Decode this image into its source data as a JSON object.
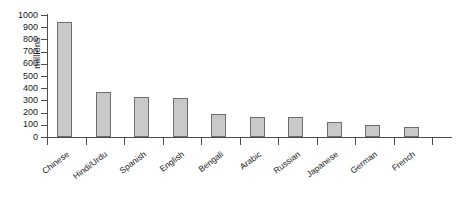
{
  "chart_data": {
    "type": "bar",
    "title": "",
    "xlabel": "",
    "ylabel": "millions",
    "ylim": [
      0,
      1000
    ],
    "ytick_step": 100,
    "grid": false,
    "legend": "none",
    "categories": [
      "Chinese",
      "Hindi/Urdu",
      "Spanish",
      "English",
      "Bengali",
      "Arabic",
      "Russian",
      "Japanese",
      "German",
      "French"
    ],
    "values": [
      940,
      370,
      330,
      320,
      185,
      160,
      160,
      120,
      95,
      78
    ],
    "ytick_labels": [
      "1000",
      "900",
      "800",
      "700",
      "600",
      "500",
      "400",
      "300",
      "200",
      "100",
      "0"
    ],
    "ytick_values": [
      1000,
      900,
      800,
      700,
      600,
      500,
      400,
      300,
      200,
      100,
      0
    ],
    "bar_fill": "#c9c9c9",
    "bar_border": "#6e6e6e",
    "axis_color": "#4c4c4c",
    "background": "#ffffff"
  }
}
